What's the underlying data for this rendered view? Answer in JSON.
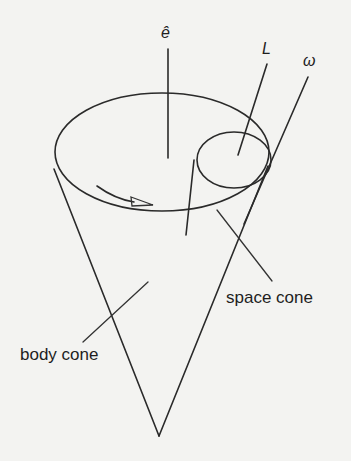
{
  "diagram": {
    "labels": {
      "axis": "ê",
      "angular_momentum": "L",
      "angular_velocity": "ω",
      "body_cone": "body cone",
      "space_cone": "space cone"
    },
    "colors": {
      "ink": "#2a2a2a",
      "background": "#f3f3f1"
    }
  }
}
